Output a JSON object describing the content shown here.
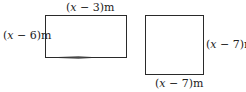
{
  "diagram": {
    "rectangle": {
      "width_label": {
        "open": "(",
        "var": "x",
        "rest": " − 3)m"
      },
      "height_label": {
        "open": "(",
        "var": "x",
        "rest": " − 6)m"
      }
    },
    "square": {
      "side_label_right": {
        "open": "(",
        "var": "x",
        "rest": " − 7)m"
      },
      "side_label_bottom": {
        "open": "(",
        "var": "x",
        "rest": " − 7)m"
      }
    }
  }
}
